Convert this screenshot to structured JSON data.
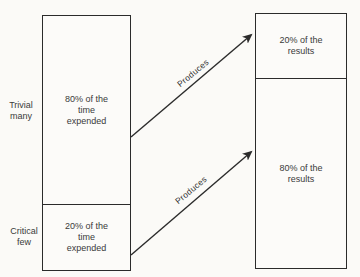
{
  "diagram": {
    "time_bar": {
      "top_section_text": "80% of the\ntime\nexpended",
      "bottom_section_text": "20% of the\ntime\nexpended"
    },
    "results_bar": {
      "top_section_text": "20% of the\nresults",
      "bottom_section_text": "80% of the\nresults"
    },
    "side_labels": {
      "trivial_many": "Trivial\nmany",
      "critical_few": "Critical\nfew"
    },
    "arrows": {
      "top": {
        "label": "Produces"
      },
      "bottom": {
        "label": "Produces"
      }
    },
    "colors": {
      "background": "#fbfaf7",
      "line": "#2b2b2b",
      "text": "#3a3a3a"
    }
  }
}
